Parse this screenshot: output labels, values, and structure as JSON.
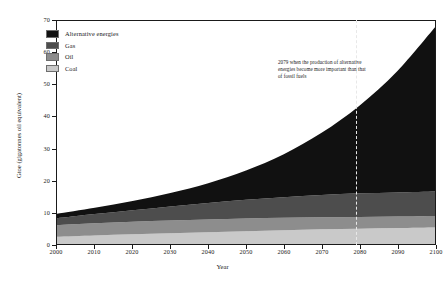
{
  "chart_data": {
    "type": "area",
    "stacked": true,
    "title": "",
    "xlabel": "Year",
    "ylabel": "Gtoe (gigatonnes oil equivalent)",
    "xlim": [
      2000,
      2100
    ],
    "ylim": [
      0,
      70
    ],
    "xticks": [
      2000,
      2010,
      2020,
      2030,
      2040,
      2050,
      2060,
      2070,
      2080,
      2090,
      2100
    ],
    "yticks": [
      0,
      10,
      20,
      30,
      40,
      50,
      60,
      70
    ],
    "grid": false,
    "legend_position": "top-left",
    "x": [
      2000,
      2010,
      2020,
      2030,
      2040,
      2050,
      2060,
      2070,
      2080,
      2090,
      2100
    ],
    "series": [
      {
        "name": "Coal",
        "color": "#c9c9c9",
        "values": [
          2.3,
          2.7,
          3.1,
          3.4,
          3.7,
          4.0,
          4.3,
          4.6,
          4.8,
          5.0,
          5.2
        ]
      },
      {
        "name": "Oil",
        "color": "#8d8d8d",
        "values": [
          3.6,
          3.8,
          3.9,
          4.0,
          4.0,
          4.0,
          3.9,
          3.8,
          3.7,
          3.6,
          3.6
        ]
      },
      {
        "name": "Gas",
        "color": "#4d4d4d",
        "values": [
          2.2,
          2.9,
          3.6,
          4.4,
          5.2,
          5.9,
          6.5,
          7.0,
          7.4,
          7.6,
          7.7
        ]
      },
      {
        "name": "Alternative energies",
        "color": "#111111",
        "values": [
          1.4,
          2.0,
          2.9,
          4.2,
          6.2,
          9.2,
          13.5,
          19.5,
          27.5,
          38.0,
          51.5
        ]
      }
    ],
    "stack_tops": {
      "coal": [
        2.3,
        2.7,
        3.1,
        3.4,
        3.7,
        4.0,
        4.3,
        4.6,
        4.8,
        5.0,
        5.2
      ],
      "oil": [
        5.9,
        6.5,
        7.0,
        7.4,
        7.7,
        8.0,
        8.2,
        8.4,
        8.5,
        8.6,
        8.8
      ],
      "gas": [
        8.1,
        9.4,
        10.6,
        11.8,
        12.9,
        13.9,
        14.7,
        15.4,
        15.9,
        16.2,
        16.5
      ],
      "total": [
        9.5,
        11.4,
        13.5,
        16.0,
        19.1,
        23.1,
        28.2,
        34.9,
        43.4,
        54.2,
        68.0
      ]
    },
    "annotation": {
      "year": 2079,
      "text": "2079 when the production of alternative energies become more important than that of fossil fuels"
    }
  },
  "legend": {
    "items": [
      {
        "label": "Alternative energies",
        "color": "#111111"
      },
      {
        "label": "Gas",
        "color": "#4d4d4d"
      },
      {
        "label": "Oil",
        "color": "#8d8d8d"
      },
      {
        "label": "Coal",
        "color": "#c9c9c9"
      }
    ]
  },
  "axes": {
    "x_label": "Year",
    "y_label": "Gtoe (gigatonnes oil equivalent)",
    "x_tick_labels": [
      "2000",
      "2010",
      "2020",
      "2030",
      "2040",
      "2050",
      "2060",
      "2070",
      "2080",
      "2090",
      "2100"
    ],
    "y_tick_labels": [
      "0",
      "10",
      "20",
      "30",
      "40",
      "50",
      "60",
      "70"
    ]
  },
  "annotation_text": "2079 when the production of alternative energies become more important than that of fossil fuels"
}
